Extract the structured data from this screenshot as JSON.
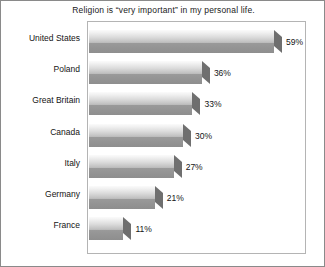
{
  "chart_data": {
    "type": "bar",
    "orientation": "horizontal",
    "title": "Religion is “very important” in my personal life.",
    "xlabel": "",
    "ylabel": "",
    "xlim": [
      0,
      70
    ],
    "grid": false,
    "legend": "none",
    "value_suffix": "%",
    "categories": [
      "United States",
      "Poland",
      "Great Britain",
      "Canada",
      "Italy",
      "Germany",
      "France"
    ],
    "values": [
      59,
      36,
      33,
      30,
      27,
      21,
      11
    ],
    "value_labels": [
      "59%",
      "36%",
      "33%",
      "30%",
      "27%",
      "21%",
      "11%"
    ],
    "bars": [
      {
        "category": "United States",
        "value": 59,
        "label": "59%"
      },
      {
        "category": "Poland",
        "value": 36,
        "label": "36%"
      },
      {
        "category": "Great Britain",
        "value": 33,
        "label": "33%"
      },
      {
        "category": "Canada",
        "value": 30,
        "label": "30%"
      },
      {
        "category": "Italy",
        "value": 27,
        "label": "27%"
      },
      {
        "category": "Germany",
        "value": 21,
        "label": "21%"
      },
      {
        "category": "France",
        "value": 11,
        "label": "11%"
      }
    ],
    "colors": {
      "bar_top_light": "#fbfbfb",
      "bar_top_dark": "#b9b9b9",
      "bar_front": "#949494",
      "bar_cap": "#6f6f6f",
      "text": "#141414",
      "plot_border": "#b4b4b4",
      "figure_border": "#8a8a8a",
      "background": "#ffffff"
    }
  }
}
